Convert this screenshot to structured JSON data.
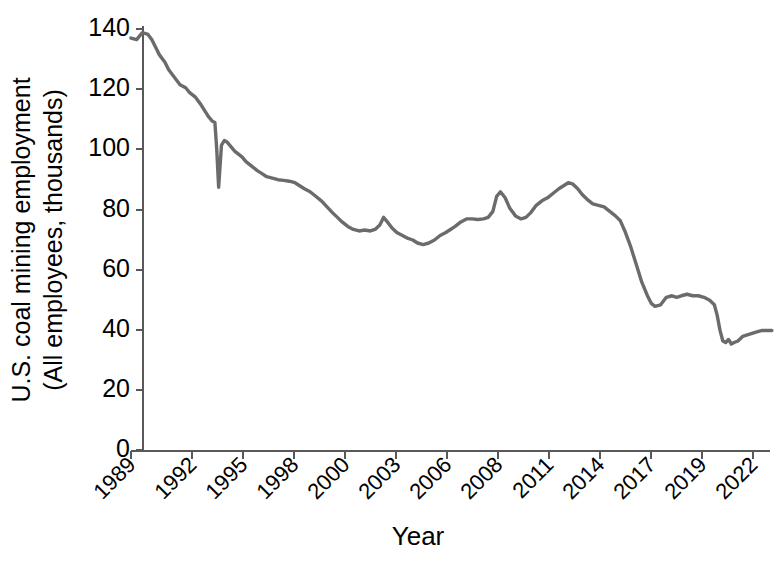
{
  "chart_data": {
    "type": "line",
    "title": "",
    "xlabel": "Year",
    "ylabel_line1": "U.S. coal mining employment",
    "ylabel_line2": "(All employees, thousands)",
    "ylim": [
      0,
      140
    ],
    "yticks": [
      0,
      20,
      40,
      60,
      80,
      100,
      120,
      140
    ],
    "ytick_labels": [
      "0",
      "20",
      "40",
      "60",
      "80",
      "100",
      "120",
      "140"
    ],
    "xlim": [
      1989.0,
      2023.0
    ],
    "xticks": [
      1989,
      1992,
      1995,
      1998,
      2000,
      2003,
      2006,
      2008,
      2011,
      2014,
      2017,
      2019,
      2022
    ],
    "xtick_labels": [
      "1989",
      "1992",
      "1995",
      "1998",
      "2000",
      "2003",
      "2006",
      "2008",
      "2011",
      "2014",
      "2017",
      "2019",
      "2022"
    ],
    "grid": false,
    "legend": "none",
    "line_color": "#6b6b6b",
    "axis_color": "#595959",
    "series": [
      {
        "name": "U.S. coal mining employment",
        "units": "thousands of employees",
        "x": [
          1989.0,
          1989.3,
          1989.6,
          1989.9,
          1990.1,
          1990.3,
          1990.5,
          1990.8,
          1991.0,
          1991.3,
          1991.6,
          1991.9,
          1992.1,
          1992.4,
          1992.7,
          1992.95,
          1993.1,
          1993.3,
          1993.45,
          1993.55,
          1993.65,
          1993.8,
          1993.95,
          1994.1,
          1994.3,
          1994.5,
          1994.7,
          1994.9,
          1995.1,
          1995.4,
          1995.7,
          1995.95,
          1996.2,
          1996.5,
          1996.8,
          1997.1,
          1997.4,
          1997.7,
          1997.95,
          1998.2,
          1998.5,
          1998.8,
          1999.1,
          1999.4,
          1999.7,
          1999.95,
          2000.2,
          2000.5,
          2000.8,
          2001.1,
          2001.4,
          2001.7,
          2001.95,
          2002.2,
          2002.4,
          2002.6,
          2002.85,
          2003.1,
          2003.4,
          2003.7,
          2003.95,
          2004.2,
          2004.5,
          2004.8,
          2005.1,
          2005.4,
          2005.7,
          2005.95,
          2006.2,
          2006.5,
          2006.8,
          2007.1,
          2007.4,
          2007.7,
          2007.95,
          2008.2,
          2008.4,
          2008.6,
          2008.85,
          2009.1,
          2009.4,
          2009.7,
          2009.95,
          2010.2,
          2010.5,
          2010.8,
          2011.1,
          2011.4,
          2011.7,
          2011.95,
          2012.2,
          2012.45,
          2012.7,
          2012.95,
          2013.2,
          2013.5,
          2013.8,
          2014.1,
          2014.4,
          2014.7,
          2014.95,
          2015.2,
          2015.5,
          2015.8,
          2016.1,
          2016.4,
          2016.6,
          2016.8,
          2017.1,
          2017.4,
          2017.7,
          2017.95,
          2018.2,
          2018.5,
          2018.8,
          2019.1,
          2019.4,
          2019.7,
          2019.95,
          2020.1,
          2020.25,
          2020.4,
          2020.55,
          2020.7,
          2020.85,
          2021.0,
          2021.2,
          2021.45,
          2021.7,
          2021.95,
          2022.2,
          2022.5,
          2022.8,
          2023.0
        ],
        "y": [
          137.0,
          136.5,
          138.8,
          138.2,
          136.5,
          134.0,
          131.5,
          129.0,
          126.5,
          124.0,
          121.5,
          120.5,
          119.0,
          117.5,
          115.0,
          112.5,
          111.0,
          109.5,
          109.0,
          100.0,
          87.5,
          101.5,
          103.0,
          102.5,
          101.0,
          99.5,
          98.5,
          97.5,
          96.0,
          94.5,
          93.0,
          92.0,
          91.0,
          90.5,
          90.0,
          89.8,
          89.5,
          89.0,
          88.0,
          87.0,
          86.0,
          84.5,
          83.0,
          81.0,
          79.0,
          77.5,
          76.0,
          74.5,
          73.5,
          73.0,
          73.3,
          73.0,
          73.5,
          75.0,
          77.5,
          76.0,
          74.0,
          72.5,
          71.5,
          70.5,
          70.0,
          69.0,
          68.5,
          69.0,
          70.0,
          71.5,
          72.5,
          73.5,
          74.5,
          76.0,
          77.0,
          77.0,
          76.8,
          77.0,
          77.5,
          79.5,
          84.5,
          86.0,
          84.0,
          80.5,
          78.0,
          77.0,
          77.5,
          79.0,
          81.5,
          83.0,
          84.0,
          85.5,
          87.0,
          88.0,
          89.0,
          88.5,
          87.0,
          85.0,
          83.5,
          82.0,
          81.5,
          81.0,
          79.5,
          78.0,
          76.5,
          73.0,
          68.0,
          62.0,
          56.0,
          51.5,
          49.0,
          48.0,
          48.5,
          51.0,
          51.5,
          51.0,
          51.5,
          52.0,
          51.5,
          51.5,
          51.0,
          50.0,
          48.5,
          45.0,
          40.0,
          36.5,
          36.0,
          37.0,
          35.5,
          36.0,
          36.5,
          38.0,
          38.5,
          39.0,
          39.5,
          40.0,
          40.0,
          40.0
        ]
      }
    ],
    "annotations": [
      {
        "label": "peak near 139 thousand in 1989-1990"
      },
      {
        "label": "sharp dip to about 87 thousand during 1993 strike"
      },
      {
        "label": "local peak about 86 thousand in 2008"
      },
      {
        "label": "local peak about 89 thousand in 2011-2012"
      },
      {
        "label": "steep decline to about 48 thousand by 2016"
      },
      {
        "label": "COVID trough about 35-36 thousand in 2020"
      },
      {
        "label": "recovery to about 40 thousand by 2022"
      }
    ]
  },
  "accessibility": {
    "figure_name": "us-coal-mining-employment-line-chart"
  }
}
